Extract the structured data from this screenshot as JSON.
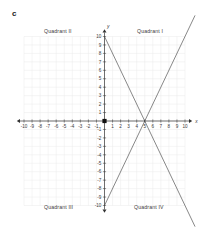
{
  "figure": {
    "part_label": "c"
  },
  "quadrants": [
    {
      "id": "quadrant-1",
      "label": "Quadrant I"
    },
    {
      "id": "quadrant-2",
      "label": "Quadrant II"
    },
    {
      "id": "quadrant-3",
      "label": "Quadrant III"
    },
    {
      "id": "quadrant-4",
      "label": "Quadrant IV"
    }
  ],
  "chart_data": {
    "type": "line",
    "title": "",
    "xlabel": "x",
    "ylabel": "y",
    "xlim": [
      -10,
      10
    ],
    "ylim": [
      -10,
      10
    ],
    "grid": true,
    "x_ticks": [
      -10,
      -9,
      -8,
      -7,
      -6,
      -5,
      -4,
      -3,
      -2,
      -1,
      1,
      2,
      3,
      4,
      5,
      6,
      7,
      8,
      9,
      10
    ],
    "y_ticks": [
      10,
      9,
      8,
      7,
      6,
      5,
      4,
      3,
      2,
      1,
      -1,
      -2,
      -3,
      -4,
      -5,
      -6,
      -7,
      -8,
      -9,
      -10
    ],
    "x_tick_labels": [
      "-10",
      "-9",
      "-8",
      "-7",
      "-6",
      "-5",
      "-4",
      "-3",
      "-2",
      "-1",
      "1",
      "2",
      "3",
      "4",
      "5",
      "6",
      "7",
      "8",
      "9",
      "10"
    ],
    "y_tick_labels": [
      "10",
      "9",
      "8",
      "7",
      "6",
      "5",
      "4",
      "3",
      "2",
      "1",
      "-1",
      "-2",
      "-3",
      "-4",
      "-5",
      "-6",
      "-7",
      "-8",
      "-9",
      "-10"
    ],
    "origin_marker": true,
    "series": [
      {
        "name": "descending-line",
        "slope": -2,
        "intercept": 10,
        "points": [
          [
            0,
            10
          ],
          [
            5,
            0
          ],
          [
            10,
            -10
          ]
        ]
      },
      {
        "name": "ascending-line",
        "slope": 2,
        "intercept": -10,
        "points": [
          [
            0,
            -10
          ],
          [
            5,
            0
          ],
          [
            10,
            10
          ]
        ]
      }
    ],
    "intersection": [
      5,
      0
    ],
    "line_color": "#555555",
    "axis_color": "#333333",
    "grid_color": "#ebebeb"
  }
}
